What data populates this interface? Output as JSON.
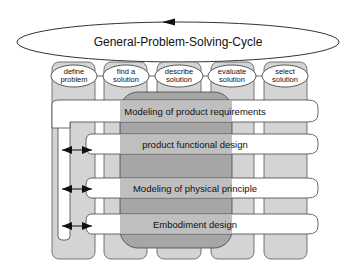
{
  "cycle": {
    "title": "General-Problem-Solving-Cycle",
    "steps": [
      {
        "line1": "define",
        "line2": "problem"
      },
      {
        "line1": "find a",
        "line2": "solution"
      },
      {
        "line1": "describe",
        "line2": "solution"
      },
      {
        "line1": "evaluate",
        "line2": "solution"
      },
      {
        "line1": "select",
        "line2": "solution"
      }
    ]
  },
  "phases": [
    {
      "label": "Modeling of product requirements"
    },
    {
      "label": "product functional design"
    },
    {
      "label": "Modeling of physical principle"
    },
    {
      "label": "Embodiment design"
    }
  ],
  "colors": {
    "column_fill": "#d4d4d4",
    "column_top": "#c4c4c4",
    "central_block": "#a9a9a9",
    "central_block_dark": "#8f8f8f",
    "band_fill": "#ffffff",
    "stroke": "#333333"
  }
}
